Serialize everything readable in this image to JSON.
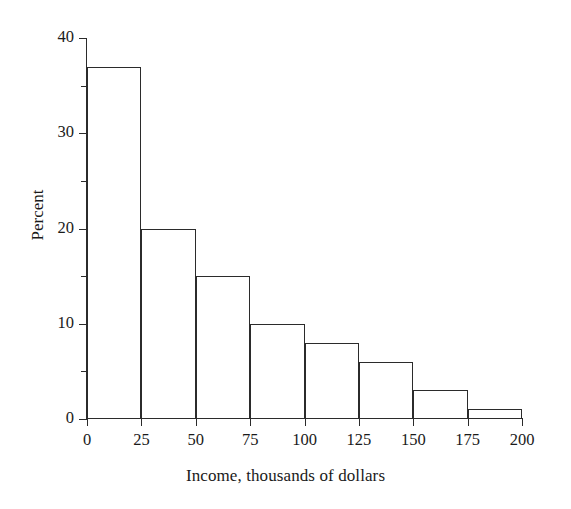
{
  "chart_data": {
    "type": "bar",
    "title": "",
    "subtitle": "",
    "xlabel": "Income, thousands of dollars",
    "ylabel": "Percent",
    "xlim": [
      0,
      200
    ],
    "ylim": [
      0,
      40
    ],
    "grid": false,
    "legend": null,
    "bin_width": 25,
    "bin_edges": [
      0,
      25,
      50,
      75,
      100,
      125,
      150,
      175,
      200
    ],
    "categories": [
      "0-25",
      "25-50",
      "50-75",
      "75-100",
      "100-125",
      "125-150",
      "150-175",
      "175-200"
    ],
    "values": [
      37,
      20,
      15,
      10,
      8,
      6,
      3,
      1
    ],
    "x_ticks": [
      0,
      25,
      50,
      75,
      100,
      125,
      150,
      175,
      200
    ],
    "x_tick_labels": [
      "0",
      "25",
      "50",
      "75",
      "100",
      "125",
      "150",
      "175",
      "200"
    ],
    "y_ticks": [
      0,
      10,
      20,
      30,
      40
    ],
    "y_tick_labels": [
      "0",
      "10",
      "20",
      "30",
      "40"
    ],
    "y_minor_ticks": [
      5,
      15,
      25,
      35
    ],
    "bar_style": {
      "fill": "none",
      "edge_color": "#2b2b2b",
      "edge_width": 1.4
    },
    "axis_color": "#2b2b2b",
    "background_color": "#ffffff"
  }
}
